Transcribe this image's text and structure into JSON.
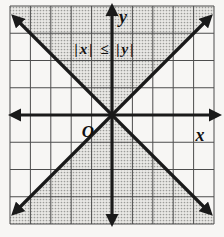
{
  "figure": {
    "labels": {
      "inequality": "|x| ≤ |y|",
      "x_axis": "x",
      "y_axis": "y",
      "origin": "O"
    },
    "colors": {
      "line": "#1a1a1a",
      "grid": "#4d4d4d",
      "shade_base": "#e9e8e5",
      "shade_dot": "#9c9c99",
      "background": "#f7f6f4",
      "text": "#111111"
    }
  }
}
